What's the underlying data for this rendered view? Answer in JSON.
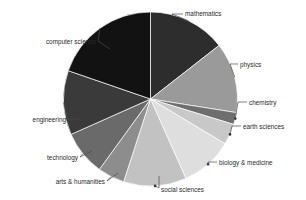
{
  "chart_data": {
    "type": "pie",
    "title": "",
    "subtitle": "",
    "xlabel": "",
    "ylabel": "",
    "legend_position": "none",
    "grid": false,
    "labels_outside": true,
    "start_angle_deg": 0,
    "direction": "clockwise",
    "center": {
      "x": 150.5,
      "y": 99
    },
    "radius": 87,
    "categories": [
      "mathematics",
      "physics",
      "chemistry",
      "earth sciences",
      "biology & medicine",
      "social sciences",
      "arts & humanities",
      "technology",
      "engineering",
      "computer science"
    ],
    "values": [
      14.4,
      13.1,
      2.2,
      3.9,
      9.7,
      11.7,
      5.0,
      8.3,
      11.9,
      19.8
    ],
    "angles_deg": [
      52,
      47,
      8,
      14,
      35,
      42,
      18,
      30,
      43,
      71
    ],
    "colors": [
      "#2d2d2d",
      "#9a9a9a",
      "#6e6e6e",
      "#c8c8c8",
      "#dedede",
      "#c2c2c2",
      "#8d8d8d",
      "#6a6a6a",
      "#3a3a3a",
      "#121212"
    ],
    "slices": [
      {
        "label": "mathematics",
        "value": 14.4,
        "angle_deg": 52,
        "color": "#2d2d2d"
      },
      {
        "label": "physics",
        "value": 13.1,
        "angle_deg": 47,
        "color": "#9a9a9a"
      },
      {
        "label": "chemistry",
        "value": 2.2,
        "angle_deg": 8,
        "color": "#6e6e6e"
      },
      {
        "label": "earth sciences",
        "value": 3.9,
        "angle_deg": 14,
        "color": "#c8c8c8"
      },
      {
        "label": "biology & medicine",
        "value": 9.7,
        "angle_deg": 35,
        "color": "#dedede"
      },
      {
        "label": "social sciences",
        "value": 11.7,
        "angle_deg": 42,
        "color": "#c2c2c2"
      },
      {
        "label": "arts & humanities",
        "value": 5.0,
        "angle_deg": 18,
        "color": "#8d8d8d"
      },
      {
        "label": "technology",
        "value": 8.3,
        "angle_deg": 30,
        "color": "#6a6a6a"
      },
      {
        "label": "engineering",
        "value": 11.9,
        "angle_deg": 43,
        "color": "#3a3a3a"
      },
      {
        "label": "computer science",
        "value": 19.8,
        "angle_deg": 71,
        "color": "#121212"
      }
    ]
  },
  "labels": {
    "mathematics": "mathematics",
    "physics": "physics",
    "chemistry": "chemistry",
    "earth_sciences": "earth sciences",
    "biology_medicine": "biology & medicine",
    "social_sciences": "social sciences",
    "arts_humanities": "arts & humanities",
    "technology": "technology",
    "engineering": "engineering",
    "computer_science": "computer science"
  },
  "colors": {
    "background": "#ffffff",
    "text": "#2b2b2b",
    "leader_line": "#4a4a4a",
    "slice_border": "#ffffff"
  }
}
